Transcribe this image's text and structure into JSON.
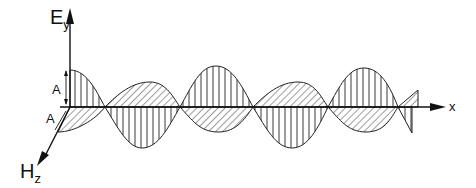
{
  "diagram": {
    "axes": {
      "e_axis": {
        "label": "E",
        "subscript": "y"
      },
      "h_axis": {
        "label": "H",
        "subscript": "z"
      },
      "x_axis": {
        "label": "x"
      }
    },
    "amplitude_labels": {
      "e_amplitude": "A",
      "h_amplitude": "A"
    },
    "colors": {
      "ink": "#111111",
      "background": "#ffffff"
    }
  }
}
